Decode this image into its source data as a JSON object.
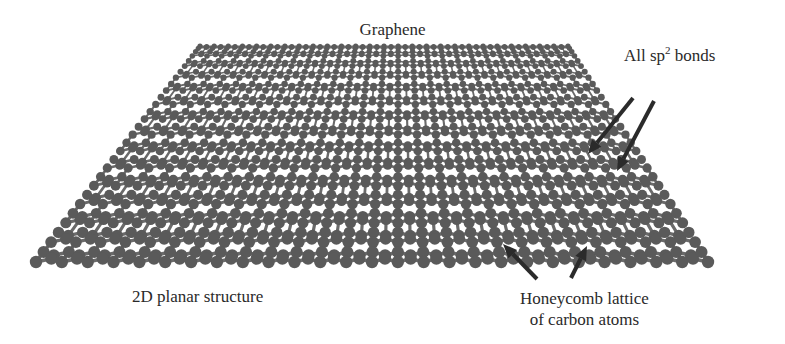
{
  "figure": {
    "title": "Graphene"
  },
  "labels": {
    "sp2": {
      "prefix": "All sp",
      "superscript": "2",
      "suffix": " bonds"
    },
    "planar": "2D planar structure",
    "honeycomb_line1": "Honeycomb lattice",
    "honeycomb_line2": "of carbon atoms"
  },
  "arrows": [
    {
      "name": "sp2-arrow-1",
      "from": [
        633,
        98
      ],
      "to": [
        588,
        154
      ]
    },
    {
      "name": "sp2-arrow-2",
      "from": [
        654,
        101
      ],
      "to": [
        617,
        171
      ]
    },
    {
      "name": "honeycomb-arrow-1",
      "from": [
        537,
        279
      ],
      "to": [
        503,
        244
      ]
    },
    {
      "name": "honeycomb-arrow-2",
      "from": [
        571,
        278
      ],
      "to": [
        587,
        246
      ]
    }
  ],
  "lattice": {
    "top_left": [
      200,
      46
    ],
    "top_right": [
      568,
      46
    ],
    "bottom_left": [
      36,
      262
    ],
    "bottom_right": [
      708,
      262
    ],
    "columns": 26,
    "rows": 14,
    "atom_color": "#5a5a5a",
    "bond_color": "#6a6a6a",
    "arrow_color": "#2b2b2b"
  }
}
